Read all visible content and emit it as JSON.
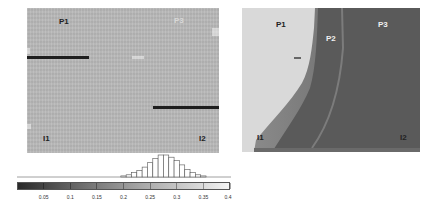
{
  "figure": {
    "left_panel": {
      "labels": {
        "p1": "P1",
        "p3": "P3",
        "i1": "I1",
        "i2": "I2"
      },
      "background_color": "#b9b9b9",
      "line_color": "#1e1e1e"
    },
    "right_panel": {
      "labels": {
        "p1": "P1",
        "p2": "P2",
        "p3": "P3",
        "i1": "I1",
        "i2": "I2"
      },
      "light_region_color": "#d9d9d9",
      "dark_region_color": "#5a5a5a"
    },
    "colorbar": {
      "ticks": [
        "0.05",
        "0.1",
        "0.15",
        "0.2",
        "0.25",
        "0.3",
        "0.35",
        "0.4"
      ],
      "range": [
        0.0,
        0.4
      ]
    },
    "histogram": {
      "description": "Histogram of values above the colorbar, peaked near 0.28"
    }
  },
  "chart_data": {
    "type": "bar",
    "title": "",
    "xlabel": "",
    "ylabel": "",
    "x": [
      0.2,
      0.21,
      0.22,
      0.23,
      0.24,
      0.25,
      0.26,
      0.27,
      0.28,
      0.29,
      0.3,
      0.31,
      0.32,
      0.33,
      0.34,
      0.35
    ],
    "values": [
      1,
      2,
      4,
      6,
      9,
      13,
      17,
      20,
      20,
      18,
      15,
      11,
      7,
      4,
      2,
      1
    ],
    "xlim": [
      0.0,
      0.4
    ],
    "tick_labels": [
      "0.05",
      "0.1",
      "0.15",
      "0.2",
      "0.25",
      "0.3",
      "0.35",
      "0.4"
    ],
    "grid": false,
    "legend": "none (grayscale colorbar below histogram)"
  }
}
